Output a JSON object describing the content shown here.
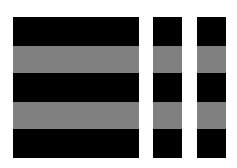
{
  "canvas": {
    "width": 237,
    "height": 168,
    "background": "#ffffff"
  },
  "colors": {
    "black": "#000000",
    "gray": "#808080"
  },
  "columns": [
    {
      "name": "column-wide",
      "x": 13,
      "width": 126
    },
    {
      "name": "column-narrow-1",
      "x": 153,
      "width": 29
    },
    {
      "name": "column-narrow-2",
      "x": 197,
      "width": 29
    }
  ],
  "bands": [
    {
      "name": "band-1",
      "color": "black",
      "top": 0,
      "height": 29
    },
    {
      "name": "band-2",
      "color": "gray",
      "top": 29,
      "height": 27
    },
    {
      "name": "band-3",
      "color": "black",
      "top": 56,
      "height": 29
    },
    {
      "name": "band-4",
      "color": "gray",
      "top": 85,
      "height": 27
    },
    {
      "name": "band-5",
      "color": "black",
      "top": 112,
      "height": 29
    }
  ]
}
